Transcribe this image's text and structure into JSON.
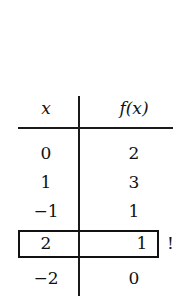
{
  "table": {
    "headers": [
      "x",
      "f(x)"
    ],
    "rows": [
      {
        "x": "0",
        "fx": "2"
      },
      {
        "x": "1",
        "fx": "3"
      },
      {
        "x": "−1",
        "fx": "1"
      },
      {
        "x": "2",
        "fx": "1"
      },
      {
        "x": "−2",
        "fx": "0"
      }
    ],
    "highlighted_row_index": 3,
    "highlight_mark": "!"
  }
}
